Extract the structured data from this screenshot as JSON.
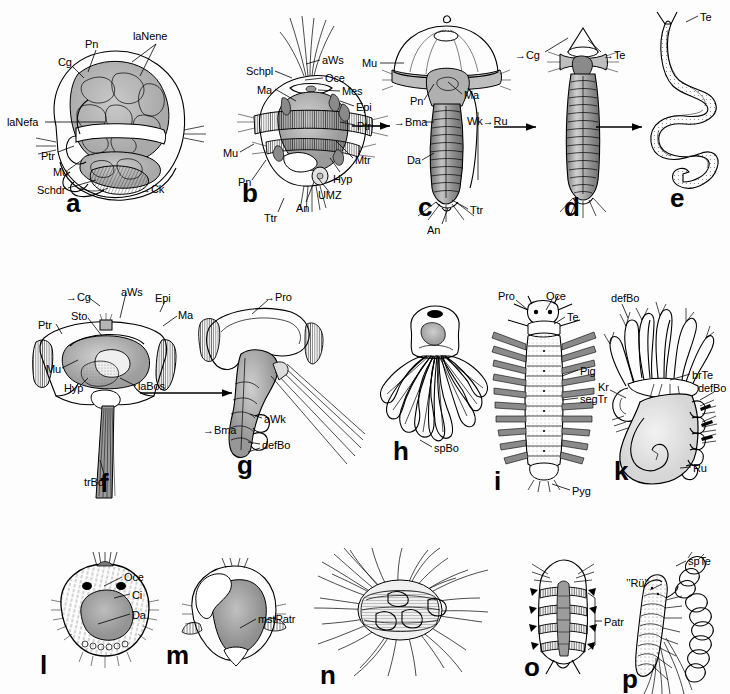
{
  "figure": {
    "panel_count": 16,
    "background_color": "#fdfdfd",
    "ink_color": "#000000"
  },
  "rows": [
    {
      "name": "row-1",
      "panels": [
        "a",
        "b",
        "c",
        "d",
        "e"
      ]
    },
    {
      "name": "row-2",
      "panels": [
        "f",
        "g",
        "h",
        "i",
        "k"
      ]
    },
    {
      "name": "row-3",
      "panels": [
        "l",
        "m",
        "n",
        "o",
        "p"
      ]
    }
  ],
  "panels": [
    {
      "letter": "a",
      "labels": [
        {
          "text": "Pn"
        },
        {
          "text": "laNene"
        },
        {
          "text": "Cg"
        },
        {
          "text": "laNefa"
        },
        {
          "text": "Ptr"
        },
        {
          "text": "Mu"
        },
        {
          "text": "Schdr"
        },
        {
          "text": "Ck"
        }
      ]
    },
    {
      "letter": "b",
      "labels": [
        {
          "text": "aWs"
        },
        {
          "text": "Schpl"
        },
        {
          "text": "Oce"
        },
        {
          "text": "Ma"
        },
        {
          "text": "Mes"
        },
        {
          "text": "Epi"
        },
        {
          "text": "Ptr"
        },
        {
          "text": "Mtr"
        },
        {
          "text": "Mu"
        },
        {
          "text": "Pn"
        },
        {
          "text": "Hyp"
        },
        {
          "text": "UMZ"
        },
        {
          "text": "An"
        },
        {
          "text": "Ttr"
        }
      ]
    },
    {
      "letter": "c",
      "labels": [
        {
          "text": "Mu"
        },
        {
          "text": "Pn"
        },
        {
          "text": "Ma"
        },
        {
          "text": "Bma"
        },
        {
          "text": "Wk"
        },
        {
          "text": "Ru"
        },
        {
          "text": "Da"
        },
        {
          "text": "Ttr"
        },
        {
          "text": "An"
        }
      ]
    },
    {
      "letter": "d",
      "labels": [
        {
          "text": "Cg"
        },
        {
          "text": "Te"
        }
      ]
    },
    {
      "letter": "e",
      "labels": [
        {
          "text": "Te"
        }
      ]
    },
    {
      "letter": "f",
      "labels": [
        {
          "text": "Cg"
        },
        {
          "text": "aWs"
        },
        {
          "text": "Epi"
        },
        {
          "text": "Sto"
        },
        {
          "text": "Ma"
        },
        {
          "text": "Ptr"
        },
        {
          "text": "Mu"
        },
        {
          "text": "Hyp"
        },
        {
          "text": "laBos"
        },
        {
          "text": "trBo"
        }
      ]
    },
    {
      "letter": "g",
      "labels": [
        {
          "text": "Pro"
        },
        {
          "text": "aWk"
        },
        {
          "text": "Bma"
        },
        {
          "text": "defBo"
        }
      ]
    },
    {
      "letter": "h",
      "labels": [
        {
          "text": "spBo"
        }
      ]
    },
    {
      "letter": "i",
      "labels": [
        {
          "text": "Pro"
        },
        {
          "text": "Oce"
        },
        {
          "text": "Te"
        },
        {
          "text": "Pig"
        },
        {
          "text": "segTr"
        },
        {
          "text": "Pyg"
        }
      ]
    },
    {
      "letter": "k",
      "labels": [
        {
          "text": "defBo"
        },
        {
          "text": "brTe"
        },
        {
          "text": "defBo"
        },
        {
          "text": "Kr"
        },
        {
          "text": "Ru"
        }
      ]
    },
    {
      "letter": "l",
      "labels": [
        {
          "text": "Oce"
        },
        {
          "text": "Ci"
        },
        {
          "text": "Da"
        }
      ]
    },
    {
      "letter": "m",
      "labels": [
        {
          "text": "mstPatr"
        }
      ]
    },
    {
      "letter": "n",
      "labels": []
    },
    {
      "letter": "o",
      "labels": [
        {
          "text": "Patr"
        }
      ]
    },
    {
      "letter": "p",
      "labels": [
        {
          "text": "’’Rü’’"
        },
        {
          "text": "spTe"
        }
      ]
    }
  ],
  "panel_letters": {
    "a": "a",
    "b": "b",
    "c": "c",
    "d": "d",
    "e": "e",
    "f": "f",
    "g": "g",
    "h": "h",
    "i": "i",
    "k": "k",
    "l": "l",
    "m": "m",
    "n": "n",
    "o": "o",
    "p": "p"
  },
  "labels": {
    "a_pn": "Pn",
    "a_lanene": "laNene",
    "a_cg": "Cg",
    "a_lanefa": "laNefa",
    "a_ptr": "Ptr",
    "a_mu": "Mu",
    "a_schdr": "Schdr",
    "a_ck": "Ck",
    "b_aws": "aWs",
    "b_schpl": "Schpl",
    "b_oce": "Oce",
    "b_ma": "Ma",
    "b_mes": "Mes",
    "b_epi": "Epi",
    "b_ptr": "Ptr",
    "b_mtr": "Mtr",
    "b_mu": "Mu",
    "b_pn": "Pn",
    "b_hyp": "Hyp",
    "b_umz": "UMZ",
    "b_an": "An",
    "b_ttr": "Ttr",
    "c_mu": "Mu",
    "c_pn": "Pn",
    "c_ma": "Ma",
    "c_bma": "Bma",
    "c_wk": "Wk",
    "c_ru": "Ru",
    "c_da": "Da",
    "c_ttr": "Ttr",
    "c_an": "An",
    "d_cg": "Cg",
    "d_te": "Te",
    "e_te": "Te",
    "f_cg": "Cg",
    "f_aws": "aWs",
    "f_epi": "Epi",
    "f_sto": "Sto",
    "f_ma": "Ma",
    "f_ptr": "Ptr",
    "f_mu": "Mu",
    "f_hyp": "Hyp",
    "f_labos": "laBos",
    "f_trbo": "trBo",
    "g_pro": "Pro",
    "g_awk": "aWk",
    "g_bma": "Bma",
    "g_defbo": "defBo",
    "h_spbo": "spBo",
    "i_pro": "Pro",
    "i_oce": "Oce",
    "i_te": "Te",
    "i_pig": "Pig",
    "i_segtr": "segTr",
    "i_pyg": "Pyg",
    "k_defbo_top": "defBo",
    "k_brte": "brTe",
    "k_defbo_right": "defBo",
    "k_kr": "Kr",
    "k_ru": "Ru",
    "l_oce": "Oce",
    "l_ci": "Ci",
    "l_da": "Da",
    "m_mstpatr": "mstPatr",
    "o_patr": "Patr",
    "p_ru": "’’Rü’’",
    "p_spte": "spTe"
  },
  "arrow_markers": {
    "cg_prefix": "→",
    "bma_prefix": "→",
    "te_prefix": "→",
    "ck_prefix": "→",
    "wk_to_ru": "→",
    "pro_prefix": "→",
    "epi_prefix": "↓"
  },
  "transition_arrows": [
    {
      "name": "arrow-b-to-c"
    },
    {
      "name": "arrow-c-to-d"
    },
    {
      "name": "arrow-d-to-e"
    },
    {
      "name": "arrow-f-to-g"
    }
  ]
}
